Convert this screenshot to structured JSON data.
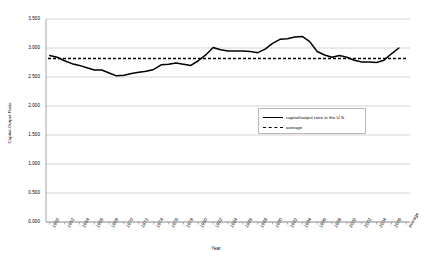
{
  "chart_data": {
    "type": "line",
    "title": "",
    "xlabel": "Year",
    "ylabel": "Capital-Output Ratio",
    "ylim": [
      0.0,
      3.5
    ],
    "ytick_labels": [
      "0.000",
      "0.500",
      "1.000",
      "1.500",
      "2.000",
      "2.500",
      "3.000",
      "3.500"
    ],
    "ytick_values": [
      0.0,
      0.5,
      1.0,
      1.5,
      2.0,
      2.5,
      3.0,
      3.5
    ],
    "grid": true,
    "legend_position": "center-right",
    "xtick_labels": [
      "1960",
      "1962",
      "1964",
      "1966",
      "1968",
      "1970",
      "1972",
      "1974",
      "1976",
      "1978",
      "1980",
      "1982",
      "1984",
      "1986",
      "1988",
      "1990",
      "1992",
      "1994",
      "1996",
      "1998",
      "2000",
      "2002",
      "2004",
      "2006",
      "average"
    ],
    "x": [
      1960,
      1961,
      1962,
      1963,
      1964,
      1965,
      1966,
      1967,
      1968,
      1969,
      1970,
      1971,
      1972,
      1973,
      1974,
      1975,
      1976,
      1977,
      1978,
      1979,
      1980,
      1981,
      1982,
      1983,
      1984,
      1985,
      1986,
      1987,
      1988,
      1989,
      1990,
      1991,
      1992,
      1993,
      1994,
      1995,
      1996,
      1997,
      1998,
      1999,
      2000,
      2001,
      2002,
      2003,
      2004,
      2005,
      2006,
      2007
    ],
    "series": [
      {
        "name": "capital/output ratio in the U.S.",
        "style": "solid",
        "color": "#000000",
        "values": [
          2.87,
          2.84,
          2.78,
          2.73,
          2.7,
          2.66,
          2.62,
          2.62,
          2.57,
          2.52,
          2.53,
          2.56,
          2.58,
          2.6,
          2.63,
          2.71,
          2.72,
          2.74,
          2.72,
          2.7,
          2.78,
          2.88,
          3.01,
          2.97,
          2.95,
          2.95,
          2.95,
          2.94,
          2.92,
          2.98,
          3.08,
          3.15,
          3.16,
          3.19,
          3.2,
          3.11,
          2.94,
          2.88,
          2.84,
          2.87,
          2.84,
          2.79,
          2.76,
          2.76,
          2.75,
          2.79,
          2.9,
          3.0
        ]
      },
      {
        "name": "average",
        "style": "dashed",
        "color": "#000000",
        "constant": 2.82
      }
    ]
  },
  "legend": {
    "entries": [
      {
        "label": "capital/output ratio in the U.S."
      },
      {
        "label": "average"
      }
    ]
  },
  "axes": {
    "x_title": "Year",
    "y_title": "Capital-Output Ratio"
  }
}
